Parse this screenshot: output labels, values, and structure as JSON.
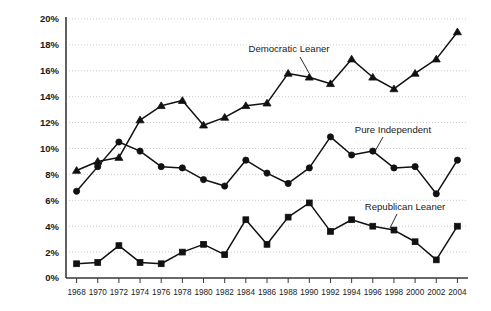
{
  "chart_data": {
    "type": "line",
    "title": "",
    "xlabel": "",
    "ylabel": "",
    "grid": true,
    "legend_position": "inline-annotations",
    "x": [
      1968,
      1970,
      1972,
      1974,
      1976,
      1978,
      1980,
      1982,
      1984,
      1986,
      1988,
      1990,
      1992,
      1994,
      1996,
      1998,
      2000,
      2002,
      2004
    ],
    "categories": [
      "1968",
      "1970",
      "1972",
      "1974",
      "1976",
      "1978",
      "1980",
      "1982",
      "1984",
      "1986",
      "1988",
      "1990",
      "1992",
      "1994",
      "1996",
      "1998",
      "2000",
      "2002",
      "2004"
    ],
    "xlim": [
      1967,
      2005
    ],
    "ylim": [
      0,
      20
    ],
    "ytick_values": [
      0,
      2,
      4,
      6,
      8,
      10,
      12,
      14,
      16,
      18,
      20
    ],
    "ytick_labels": [
      "0%",
      "2%",
      "4%",
      "6%",
      "8%",
      "10%",
      "12%",
      "14%",
      "16%",
      "18%",
      "20%"
    ],
    "series": [
      {
        "name": "Democratic Leaner",
        "marker": "triangle",
        "color": "#111111",
        "values": [
          8.3,
          9.0,
          9.3,
          12.2,
          13.3,
          13.7,
          11.8,
          12.4,
          13.3,
          13.5,
          15.8,
          15.5,
          15.0,
          16.9,
          15.5,
          14.6,
          15.8,
          16.9,
          19.0
        ]
      },
      {
        "name": "Pure Independent",
        "marker": "circle",
        "color": "#111111",
        "values": [
          6.7,
          8.6,
          10.5,
          9.8,
          8.6,
          8.5,
          7.6,
          7.1,
          9.1,
          8.1,
          7.3,
          8.5,
          10.9,
          9.5,
          9.8,
          8.5,
          8.6,
          6.5,
          9.1
        ]
      },
      {
        "name": "Republican Leaner",
        "marker": "square",
        "color": "#111111",
        "values": [
          1.1,
          1.2,
          2.5,
          1.2,
          1.1,
          2.0,
          2.6,
          1.8,
          4.5,
          2.6,
          4.7,
          5.8,
          3.6,
          4.5,
          4.0,
          3.7,
          2.8,
          1.4,
          4.0
        ]
      }
    ],
    "annotations": [
      {
        "text": "Democratic Leaner",
        "series": "Democratic Leaner",
        "label_x": 289,
        "label_y": 52,
        "leader_from_x": 300,
        "leader_from_y": 57,
        "leader_to_x": 309,
        "leader_to_y": 73
      },
      {
        "text": "Pure Independent",
        "series": "Pure Independent",
        "label_x": 393,
        "label_y": 133,
        "leader_from_x": 383,
        "leader_from_y": 137,
        "leader_to_x": 374,
        "leader_to_y": 153
      },
      {
        "text": "Republican Leaner",
        "series": "Republican Leaner",
        "label_x": 405,
        "label_y": 210,
        "leader_from_x": 397,
        "leader_from_y": 214,
        "leader_to_x": 390,
        "leader_to_y": 228
      }
    ]
  }
}
